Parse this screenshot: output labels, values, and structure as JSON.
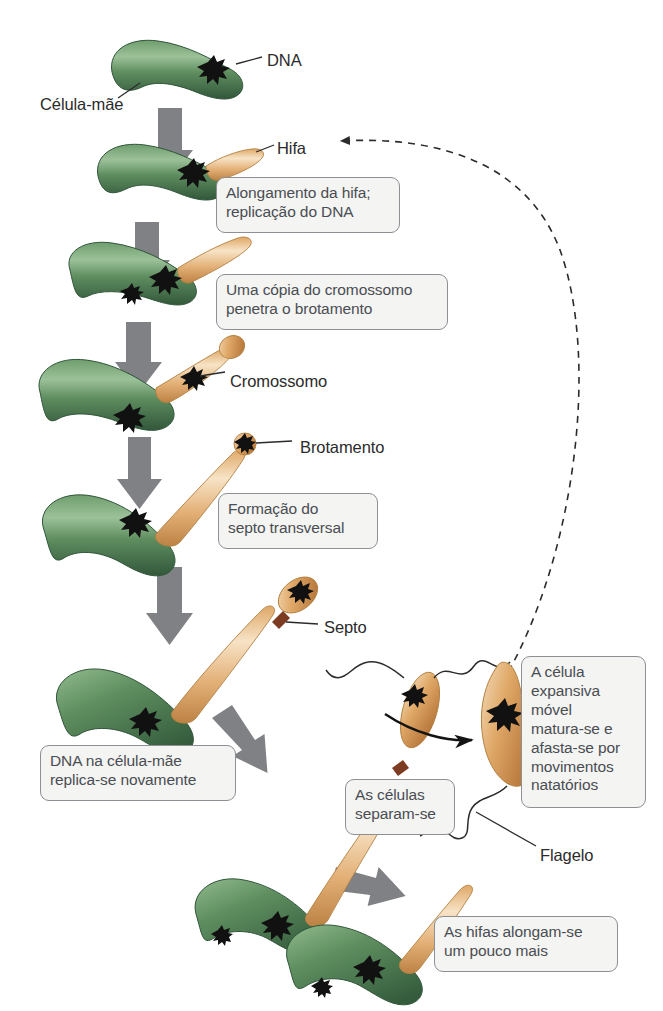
{
  "figure": {
    "language": "pt-BR",
    "background_color": "#ffffff"
  },
  "palette": {
    "mother_cell_green_dark": "#3f6b49",
    "mother_cell_green_mid": "#5b8f5f",
    "mother_cell_green_light": "#8fb98c",
    "hypha_orange_dark": "#c98a46",
    "hypha_orange_mid": "#e0aa6c",
    "hypha_orange_light": "#f6e0c2",
    "septum_brown": "#7d3b22",
    "dna_black": "#111111",
    "arrow_gray": "#7f8184",
    "callout_fill": "#f4f4f2",
    "callout_border": "#8c8f93",
    "callout_text": "#4a4d52",
    "label_text": "#2b2b2b",
    "leader_line": "#2b2b2b",
    "dashed_curve": "#2b2b2b"
  },
  "callouts": [
    {
      "id": "elongacao",
      "text": "Alongamento da hifa;\nreplicação do DNA",
      "x": 216,
      "y": 177,
      "w": 184,
      "h": 56
    },
    {
      "id": "copia",
      "text": "Uma cópia do cromossomo\npenetra o brotamento",
      "x": 216,
      "y": 274,
      "w": 232,
      "h": 56
    },
    {
      "id": "septo",
      "text": "Formação do\nsepto transversal",
      "x": 218,
      "y": 493,
      "w": 160,
      "h": 56
    },
    {
      "id": "dna-replica",
      "text": "DNA na célula-mãe\nreplica-se novamente",
      "x": 40,
      "y": 745,
      "w": 196,
      "h": 56
    },
    {
      "id": "separam",
      "text": "As células\nseparam-se",
      "x": 345,
      "y": 779,
      "w": 110,
      "h": 56
    },
    {
      "id": "expansiva",
      "text": "A célula\nexpansiva\nmóvel\nmatura-se e\nafasta-se por\nmovimentos\nnatatórios",
      "x": 521,
      "y": 656,
      "w": 125,
      "h": 152
    },
    {
      "id": "alongam",
      "text": "As hifas alongam-se\num pouco mais",
      "x": 434,
      "y": 916,
      "w": 184,
      "h": 56
    }
  ],
  "labels": [
    {
      "id": "dna",
      "text": "DNA",
      "x": 267,
      "y": 51
    },
    {
      "id": "celula-mae",
      "text": "Célula-mãe",
      "x": 40,
      "y": 95
    },
    {
      "id": "hifa",
      "text": "Hifa",
      "x": 277,
      "y": 139
    },
    {
      "id": "cromossomo",
      "text": "Cromossomo",
      "x": 230,
      "y": 372
    },
    {
      "id": "brotamento",
      "text": "Brotamento",
      "x": 300,
      "y": 438
    },
    {
      "id": "septo",
      "text": "Septo",
      "x": 324,
      "y": 618
    },
    {
      "id": "flagelo",
      "text": "Flagelo",
      "x": 540,
      "y": 846
    }
  ],
  "stages": [
    {
      "id": "stage-1",
      "name": "celula-mae-com-dna",
      "description": "Célula-mãe verde com DNA"
    },
    {
      "id": "stage-2",
      "name": "celula-com-hifa-curta",
      "description": "Alongamento da hifa; replicação do DNA"
    },
    {
      "id": "stage-3",
      "name": "celula-com-hifa-media",
      "description": "Uma cópia do cromossomo penetra o brotamento"
    },
    {
      "id": "stage-4",
      "name": "celula-com-cromossomo-na-hifa",
      "description": "Cromossomo migrando pela hifa"
    },
    {
      "id": "stage-5",
      "name": "celula-com-brotamento",
      "description": "Formação do septo transversal"
    },
    {
      "id": "stage-6",
      "name": "celula-com-septo",
      "description": "Septo formado entre a célula-mãe e o brotamento"
    },
    {
      "id": "stage-7",
      "name": "celulas-separando",
      "description": "As células separam-se"
    },
    {
      "id": "stage-8",
      "name": "celula-movel-madura",
      "description": "Célula expansiva móvel com flagelo"
    },
    {
      "id": "stage-9",
      "name": "celula-mae-nova-hifa",
      "description": "As hifas alongam-se um pouco mais"
    }
  ],
  "connectors": {
    "gray_arrows": 7,
    "dashed_recycle_curve": "da célula móvel madura de volta para a hifa",
    "black_curved_arrow": "separação da célula móvel"
  }
}
